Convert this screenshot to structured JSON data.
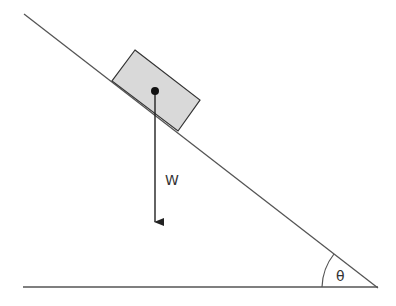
{
  "diagram": {
    "labels": {
      "weight": "W",
      "angle": "θ"
    },
    "colors": {
      "line": "#444444",
      "block_fill": "#d9d9d9",
      "block_stroke": "#333333",
      "dot": "#111111"
    }
  }
}
